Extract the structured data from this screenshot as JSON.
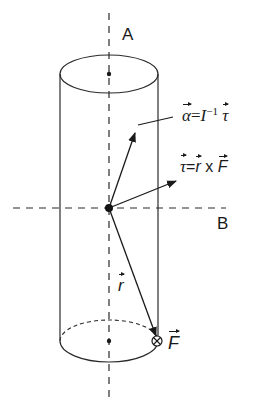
{
  "diagram": {
    "type": "physics-rigid-body-cylinder",
    "axes": {
      "vertical": {
        "label": "A"
      },
      "horizontal": {
        "label": "B"
      }
    },
    "vectors": {
      "alpha": {
        "symbol": "α",
        "equation_lhs": "α",
        "equation_eq": "=",
        "equation_inertia": "I",
        "equation_exp": "−1",
        "equation_rhs": "τ"
      },
      "tau": {
        "symbol": "τ",
        "equation_lhs": "τ",
        "equation_eq": "=",
        "equation_r": "r",
        "equation_op": "x",
        "equation_f": "F"
      },
      "r": {
        "symbol": "r"
      },
      "force": {
        "symbol": "F",
        "direction_marker": "⊗"
      }
    },
    "colors": {
      "line": "#2a2a2a",
      "background": "#ffffff"
    }
  }
}
